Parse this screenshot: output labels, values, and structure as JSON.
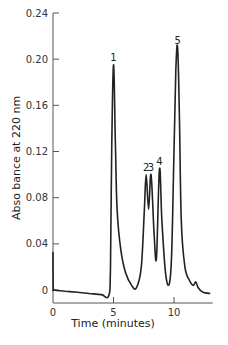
{
  "chart_data": {
    "type": "line",
    "title": "",
    "xlabel": "Time (minutes)",
    "ylabel": "Abso bance at 220 nm",
    "xlim": [
      0,
      13.2
    ],
    "ylim": [
      -0.01,
      0.24
    ],
    "x_ticks": [
      0,
      5,
      10
    ],
    "x_tick_labels": [
      "0",
      "5",
      "10"
    ],
    "y_ticks": [
      0,
      0.04,
      0.08,
      0.12,
      0.16,
      0.2,
      0.24
    ],
    "y_tick_labels": [
      "0",
      "0.04",
      "0.08",
      "0.12",
      "0.16",
      "0.20",
      "0.24"
    ],
    "grid": false,
    "legend": null,
    "series": [
      {
        "name": "chromatogram",
        "color": "#222222",
        "x": [
          0,
          0.02,
          0.1,
          1,
          2,
          3,
          4,
          4.6,
          4.75,
          4.85,
          5.0,
          5.15,
          5.3,
          5.6,
          6.0,
          6.5,
          6.9,
          7.3,
          7.55,
          7.7,
          7.9,
          8.1,
          8.35,
          8.55,
          8.8,
          9.0,
          9.3,
          9.6,
          9.8,
          10.0,
          10.15,
          10.3,
          10.45,
          10.6,
          10.9,
          11.3,
          11.6,
          11.8,
          12.0,
          12.4,
          13.0
        ],
        "y": [
          0.033,
          0.003,
          0.0,
          -0.001,
          -0.002,
          -0.003,
          -0.004,
          -0.005,
          0.02,
          0.12,
          0.195,
          0.13,
          0.07,
          0.035,
          0.015,
          0.004,
          0.002,
          0.02,
          0.07,
          0.1,
          0.07,
          0.1,
          0.05,
          0.028,
          0.105,
          0.06,
          0.015,
          0.005,
          0.03,
          0.12,
          0.19,
          0.21,
          0.15,
          0.06,
          0.02,
          0.008,
          0.004,
          0.007,
          0.002,
          -0.002,
          -0.003
        ]
      }
    ],
    "annotations": [
      {
        "text": "1",
        "x": 5.0,
        "y": 0.195
      },
      {
        "text": "2",
        "x": 7.7,
        "y": 0.1
      },
      {
        "text": "3",
        "x": 8.1,
        "y": 0.1
      },
      {
        "text": "4",
        "x": 8.8,
        "y": 0.105
      },
      {
        "text": "5",
        "x": 10.3,
        "y": 0.21
      }
    ]
  }
}
